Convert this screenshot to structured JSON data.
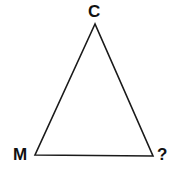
{
  "diagram": {
    "type": "triangle",
    "stroke_color": "#1a1a1a",
    "background": "#ffffff",
    "vertices": [
      {
        "id": "C",
        "label": "C",
        "x": 95,
        "y": 24
      },
      {
        "id": "M",
        "label": "M",
        "x": 35,
        "y": 155
      },
      {
        "id": "Q",
        "label": "?",
        "x": 153,
        "y": 156
      }
    ]
  }
}
